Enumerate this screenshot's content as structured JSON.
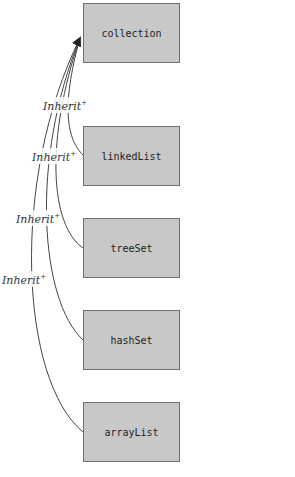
{
  "diagram": {
    "type": "inheritance",
    "nodes": [
      {
        "id": "collection",
        "label": "collection"
      },
      {
        "id": "linkedList",
        "label": "linkedList"
      },
      {
        "id": "treeSet",
        "label": "treeSet"
      },
      {
        "id": "hashSet",
        "label": "hashSet"
      },
      {
        "id": "arrayList",
        "label": "arrayList"
      }
    ],
    "edges": [
      {
        "from": "linkedList",
        "to": "collection",
        "label": "Inherit",
        "sup": "+"
      },
      {
        "from": "treeSet",
        "to": "collection",
        "label": "Inherit",
        "sup": "+"
      },
      {
        "from": "hashSet",
        "to": "collection",
        "label": "Inherit",
        "sup": "+"
      },
      {
        "from": "arrayList",
        "to": "collection",
        "label": "Inherit",
        "sup": "+"
      }
    ],
    "colors": {
      "node_fill": "#c8c8c8",
      "node_border": "#707070",
      "edge": "#333333"
    }
  }
}
